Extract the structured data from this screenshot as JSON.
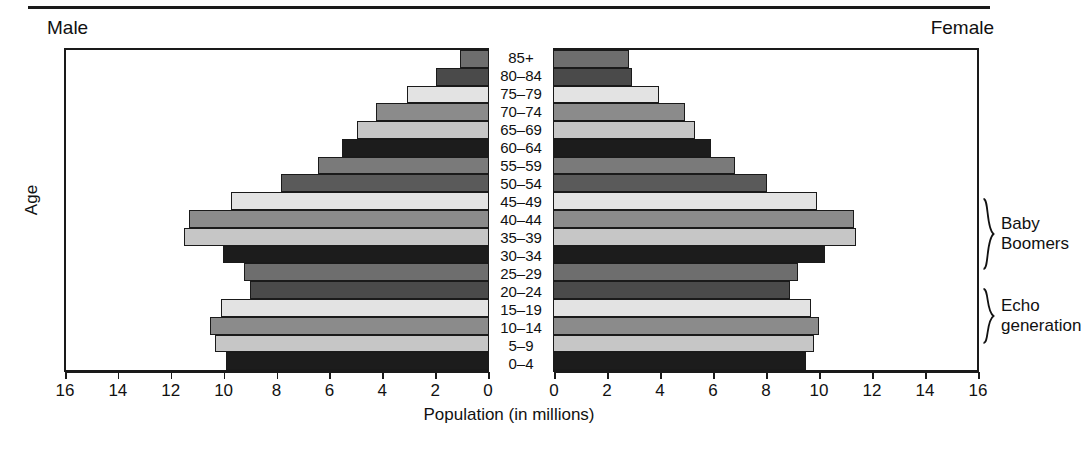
{
  "chart_data": {
    "type": "bar",
    "subtype": "population-pyramid",
    "title": "",
    "xlabel": "Population (in millions)",
    "ylabel": "Age",
    "grid": false,
    "legend_position": "none",
    "left_caption": "Male",
    "right_caption": "Female",
    "categories": [
      "85+",
      "80–84",
      "75–79",
      "70–74",
      "65–69",
      "60–64",
      "55–59",
      "50–54",
      "45–49",
      "40–44",
      "35–39",
      "30–34",
      "25–29",
      "20–24",
      "15–19",
      "10–14",
      "5–9",
      "0–4"
    ],
    "xlim": [
      0,
      16
    ],
    "xticks": [
      0,
      2,
      4,
      6,
      8,
      10,
      12,
      14,
      16
    ],
    "left_tick_labels": [
      "16",
      "14",
      "12",
      "10",
      "8",
      "6",
      "4",
      "2",
      "0"
    ],
    "right_tick_labels": [
      "0",
      "2",
      "4",
      "6",
      "8",
      "10",
      "12",
      "14",
      "16"
    ],
    "series": [
      {
        "name": "Male",
        "side": "left",
        "values": [
          1.1,
          2.0,
          3.1,
          4.3,
          5.0,
          5.6,
          6.5,
          7.9,
          9.8,
          11.4,
          11.6,
          10.1,
          9.3,
          9.1,
          10.2,
          10.6,
          10.4,
          10.0
        ]
      },
      {
        "name": "Female",
        "side": "right",
        "values": [
          2.9,
          3.0,
          4.0,
          5.0,
          5.4,
          6.0,
          6.9,
          8.1,
          10.0,
          11.4,
          11.5,
          10.3,
          9.3,
          9.0,
          9.8,
          10.1,
          9.9,
          9.6
        ]
      }
    ],
    "annotations": [
      {
        "id": "baby-boomers",
        "label": "Baby\nBoomers",
        "label_line1": "Baby",
        "label_line2": "Boomers",
        "covers": [
          "45–49",
          "40–44",
          "35–39",
          "30–34"
        ]
      },
      {
        "id": "echo-generation",
        "label": "Echo\ngeneration",
        "label_line1": "Echo",
        "label_line2": "generation",
        "covers": [
          "15–19",
          "10–14",
          "5–9"
        ]
      }
    ],
    "bar_shades": [
      "#6e6e6e",
      "#4a4a4a",
      "#e3e3e3",
      "#8b8b8b",
      "#c6c6c6",
      "#1c1c1c",
      "#7a7a7a",
      "#5a5a5a",
      "#e3e3e3",
      "#8b8b8b",
      "#c6c6c6",
      "#1c1c1c",
      "#6e6e6e",
      "#4a4a4a",
      "#e3e3e3",
      "#8b8b8b",
      "#c6c6c6",
      "#1c1c1c"
    ],
    "axis_color": "#1a1a1a",
    "background": "#ffffff"
  }
}
